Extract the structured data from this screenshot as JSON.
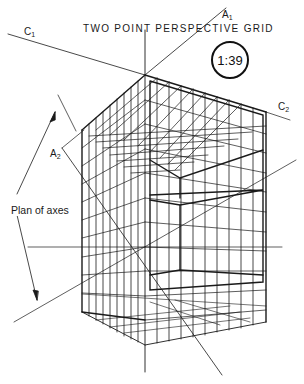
{
  "figure": {
    "title": "TWO POINT PERSPECTIVE GRID",
    "scale_badge": "1:39",
    "annotation": "Plan of axes",
    "axis_labels": {
      "c1": {
        "letter": "C",
        "sub": "1"
      },
      "c2": {
        "letter": "C",
        "sub": "2"
      },
      "a1": {
        "letter": "A",
        "sub": "1"
      },
      "a2": {
        "letter": "A",
        "sub": "2"
      }
    },
    "colors": {
      "ink": "#1a1a1a",
      "paper": "#ffffff"
    }
  }
}
